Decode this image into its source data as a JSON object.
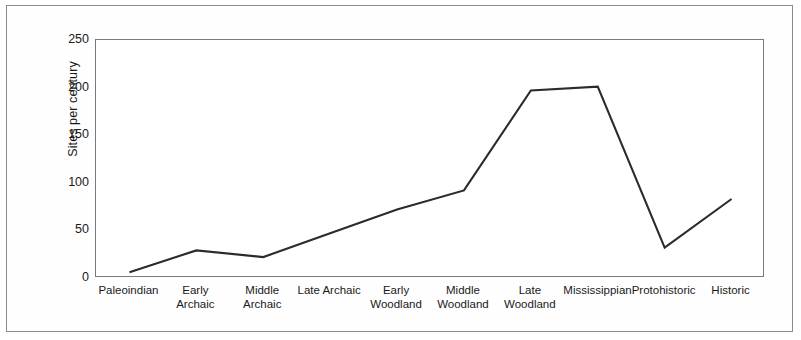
{
  "chart_data": {
    "type": "line",
    "title": "",
    "xlabel": "",
    "ylabel": "Sites per century",
    "categories": [
      "Paleoindian",
      "Early Archaic",
      "Middle\nArchaic",
      "Late Archaic",
      "Early\nWoodland",
      "Middle\nWoodland",
      "Late\nWoodland",
      "Mississippian",
      "Protohistoric",
      "Historic"
    ],
    "values": [
      6,
      29,
      22,
      47,
      72,
      92,
      197,
      201,
      32,
      83
    ],
    "ylim": [
      0,
      250
    ],
    "ytick_labels": [
      "250",
      "200",
      "150",
      "100",
      "50",
      "0"
    ],
    "ytick_values": [
      250,
      200,
      150,
      100,
      50,
      0
    ],
    "grid": false,
    "legend": false,
    "line_color": "#2b2b2b",
    "frame_color": "#7a7a7a",
    "border_color": "#8c8c8c",
    "background": "#ffffff"
  }
}
